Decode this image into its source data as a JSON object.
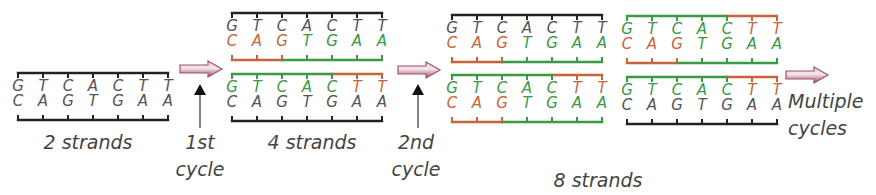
{
  "colors": {
    "original": "#222222",
    "new_cycle1": "#c8643c",
    "new_cycle2": "#3a9a44",
    "arrow_fill": "#a5506a",
    "arrow_light": "#e8d0d8",
    "text": "#444444"
  },
  "sequences": {
    "top": [
      "G",
      "T",
      "C",
      "A",
      "C",
      "T",
      "T"
    ],
    "bottom": [
      "C",
      "A",
      "G",
      "T",
      "G",
      "A",
      "A"
    ]
  },
  "stages": [
    {
      "id": "stage-2-strands",
      "label": "2 strands",
      "duplexes": [
        {
          "top_strand": "original",
          "bottom_strand": "original"
        }
      ]
    },
    {
      "id": "stage-4-strands",
      "label": "4 strands",
      "duplexes": [
        {
          "top_strand": "original",
          "bottom_strand": "primer_bottom"
        },
        {
          "top_strand": "primer_top",
          "bottom_strand": "original"
        }
      ]
    },
    {
      "id": "stage-8-strands",
      "label": "8 strands",
      "duplexes": [
        {
          "top_strand": "original",
          "bottom_strand": "primer_bottom"
        },
        {
          "top_strand": "primer_top",
          "bottom_strand": "primer_bottom"
        },
        {
          "top_strand": "primer_top",
          "bottom_strand": "primer_bottom"
        },
        {
          "top_strand": "primer_top",
          "bottom_strand": "original"
        }
      ]
    }
  ],
  "strand_types": {
    "original": {
      "description": "template strand",
      "segments": [
        [
          "original",
          0,
          6
        ]
      ]
    },
    "primer_bottom": {
      "description": "new strand primer + extension",
      "segments": [
        [
          "new_cycle1",
          0,
          2
        ],
        [
          "new_cycle2",
          2,
          6
        ]
      ]
    },
    "primer_top": {
      "description": "new strand extension + primer",
      "segments": [
        [
          "new_cycle2",
          0,
          4
        ],
        [
          "new_cycle1",
          4,
          6
        ]
      ]
    }
  },
  "cycle_labels": {
    "first": [
      "1st",
      "cycle"
    ],
    "second": [
      "2nd",
      "cycle"
    ],
    "multiple": [
      "Multiple",
      "cycles"
    ]
  }
}
